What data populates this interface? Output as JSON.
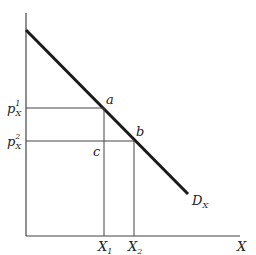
{
  "diagram": {
    "axes": {
      "x_label": "X",
      "y_label": ""
    },
    "curve": {
      "name": "D",
      "subscript": "X"
    },
    "points": [
      {
        "id": "a",
        "label": "a",
        "price": "p",
        "price_sub": "X",
        "price_sup": "1",
        "qty": "X",
        "qty_sub": "1"
      },
      {
        "id": "b",
        "label": "b",
        "price": "p",
        "price_sub": "X",
        "price_sup": "2",
        "qty": "X",
        "qty_sub": "2"
      }
    ],
    "extra_point": {
      "label": "c"
    }
  }
}
